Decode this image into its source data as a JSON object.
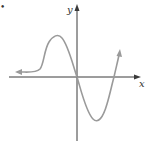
{
  "figure": {
    "marker": "•",
    "axes": {
      "x_label": "x",
      "y_label": "y"
    },
    "curve": {
      "description": "Graph of a function: approaches a horizontal asymptote toward the left (arrow), rises to a local maximum left of the y-axis, passes through the origin, falls to a local minimum right of the y-axis, then rises crossing the x-axis and continues upward (arrow)."
    },
    "colors": {
      "axis": "#3a3a3a",
      "curve": "#9a9a9a",
      "background": "#ffffff"
    }
  }
}
